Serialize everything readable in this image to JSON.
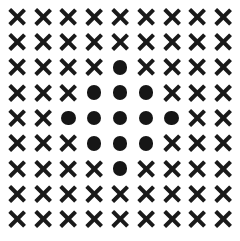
{
  "figure": {
    "title": "",
    "symbol_cross": "×",
    "symbol_dot": "●",
    "caption": "",
    "colors": {
      "background": "#ffffff",
      "foreground": "#1a1a1a"
    }
  },
  "chart_data": {
    "type": "heatmap",
    "title": "",
    "subtitle": "",
    "xlabel": "",
    "ylabel": "",
    "grid": false,
    "legend": [
      {
        "symbol": "×",
        "name": "cross",
        "value": 0
      },
      {
        "symbol": "●",
        "name": "dot",
        "value": 1
      }
    ],
    "rows": 9,
    "cols": 9,
    "x": [
      1,
      2,
      3,
      4,
      5,
      6,
      7,
      8,
      9
    ],
    "y": [
      1,
      2,
      3,
      4,
      5,
      6,
      7,
      8,
      9
    ],
    "xlim": [
      1,
      9
    ],
    "ylim": [
      1,
      9
    ],
    "values": [
      [
        0,
        0,
        0,
        0,
        0,
        0,
        0,
        0,
        0
      ],
      [
        0,
        0,
        0,
        0,
        0,
        0,
        0,
        0,
        0
      ],
      [
        0,
        0,
        0,
        0,
        1,
        0,
        0,
        0,
        0
      ],
      [
        0,
        0,
        0,
        1,
        1,
        1,
        0,
        0,
        0
      ],
      [
        0,
        0,
        1,
        1,
        1,
        1,
        1,
        0,
        0
      ],
      [
        0,
        0,
        0,
        1,
        1,
        1,
        0,
        0,
        0
      ],
      [
        0,
        0,
        0,
        0,
        1,
        0,
        0,
        0,
        0
      ],
      [
        0,
        0,
        0,
        0,
        0,
        0,
        0,
        0,
        0
      ],
      [
        0,
        0,
        0,
        0,
        0,
        0,
        0,
        0,
        0
      ]
    ],
    "symbols": [
      [
        "×",
        "×",
        "×",
        "×",
        "×",
        "×",
        "×",
        "×",
        "×"
      ],
      [
        "×",
        "×",
        "×",
        "×",
        "×",
        "×",
        "×",
        "×",
        "×"
      ],
      [
        "×",
        "×",
        "×",
        "×",
        "●",
        "×",
        "×",
        "×",
        "×"
      ],
      [
        "×",
        "×",
        "×",
        "●",
        "●",
        "●",
        "×",
        "×",
        "×"
      ],
      [
        "×",
        "×",
        "●",
        "●",
        "●",
        "●",
        "●",
        "×",
        "×"
      ],
      [
        "×",
        "×",
        "×",
        "●",
        "●",
        "●",
        "×",
        "×",
        "×"
      ],
      [
        "×",
        "×",
        "×",
        "×",
        "●",
        "×",
        "×",
        "×",
        "×"
      ],
      [
        "×",
        "×",
        "×",
        "×",
        "×",
        "×",
        "×",
        "×",
        "×"
      ],
      [
        "×",
        "×",
        "×",
        "×",
        "×",
        "×",
        "×",
        "×",
        "×"
      ]
    ],
    "dot_count": 13,
    "cross_count": 68,
    "total_cells": 81,
    "shape_description": "diamond"
  }
}
